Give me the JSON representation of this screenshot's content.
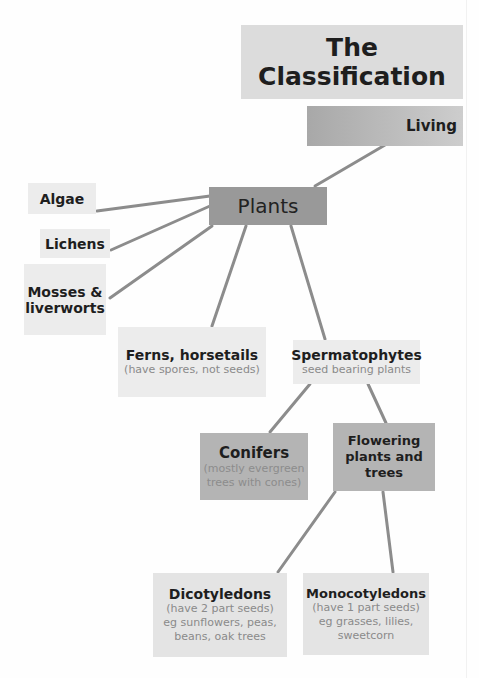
{
  "diagram": {
    "title": "The Classification",
    "nodes": {
      "living": {
        "label": "Living"
      },
      "plants": {
        "label": "Plants"
      },
      "algae": {
        "label": "Algae"
      },
      "lichens": {
        "label": "Lichens"
      },
      "mosses": {
        "label": "Mosses &",
        "label2": "liverworts"
      },
      "ferns": {
        "label": "Ferns, horsetails",
        "sub": "(have spores, not seeds)"
      },
      "spermatophytes": {
        "label": "Spermatophytes",
        "sub": "seed bearing plants"
      },
      "conifers": {
        "label": "Conifers",
        "sub1": "(mostly evergreen",
        "sub2": "trees with cones)"
      },
      "flowering": {
        "label1": "Flowering",
        "label2": "plants and",
        "label3": "trees"
      },
      "dicots": {
        "label": "Dicotyledons",
        "sub1": "(have 2 part seeds)",
        "sub2": "eg sunflowers, peas,",
        "sub3": "beans, oak trees"
      },
      "monocots": {
        "label": "Monocotyledons",
        "sub1": "(have 1 part seeds)",
        "sub2": "eg grasses, lilies,",
        "sub3": "sweetcorn"
      }
    },
    "colors": {
      "light_box": "#e8e8e8",
      "mid_box": "#b4b4b4",
      "plants_box": "#999999",
      "line": "#8c8c8c"
    }
  }
}
